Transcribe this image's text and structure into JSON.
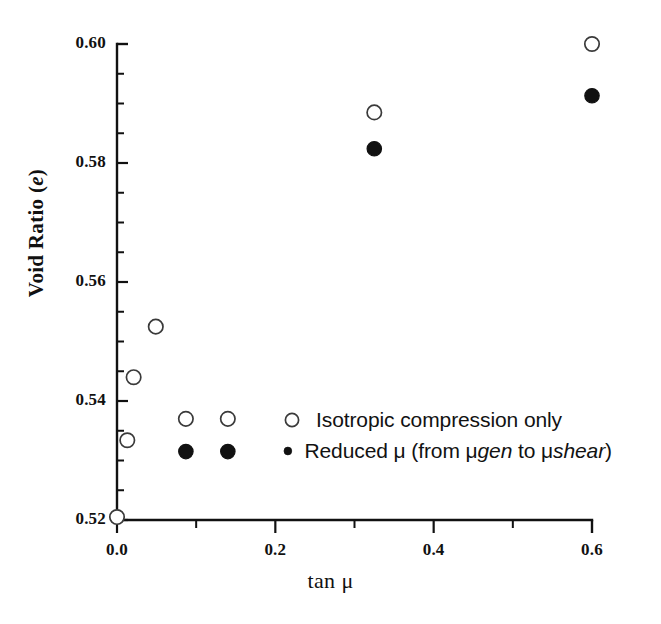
{
  "chart_data": {
    "type": "scatter",
    "title": "",
    "xlabel": "tan μ",
    "ylabel": "Void Ratio (e)",
    "ylabel_plain": "Void Ratio",
    "ylabel_italic": "e",
    "xlim": [
      0.0,
      0.6
    ],
    "ylim": [
      0.52,
      0.6
    ],
    "xticks": [
      0.0,
      0.2,
      0.4,
      0.6
    ],
    "xticklabels": [
      "0.0",
      "0.2",
      "0.4",
      "0.6"
    ],
    "x_minor_ticks": [
      0.1,
      0.3,
      0.5
    ],
    "yticks": [
      0.52,
      0.54,
      0.56,
      0.58,
      0.6
    ],
    "yticklabels": [
      "0.52",
      "0.54",
      "0.56",
      "0.58",
      "0.60"
    ],
    "y_minor_ticks": [
      0.525,
      0.53,
      0.535,
      0.545,
      0.55,
      0.555,
      0.565,
      0.57,
      0.575,
      0.585,
      0.59,
      0.595
    ],
    "grid": false,
    "legend_position": "center-right",
    "series": [
      {
        "name": "Isotropic compression only",
        "marker": "open-circle",
        "color": "#3a3a3a",
        "fill": "#ffffff",
        "points": [
          {
            "x": 0.0,
            "y": 0.5205
          },
          {
            "x": 0.013,
            "y": 0.5334
          },
          {
            "x": 0.021,
            "y": 0.544
          },
          {
            "x": 0.049,
            "y": 0.5525
          },
          {
            "x": 0.087,
            "y": 0.537
          },
          {
            "x": 0.14,
            "y": 0.537
          },
          {
            "x": 0.325,
            "y": 0.5885
          },
          {
            "x": 0.6,
            "y": 0.6
          }
        ]
      },
      {
        "name": "Reduced μ (from μgen to μshear)",
        "marker": "filled-circle",
        "color": "#111111",
        "fill": "#111111",
        "points": [
          {
            "x": 0.087,
            "y": 0.5315
          },
          {
            "x": 0.14,
            "y": 0.5315
          },
          {
            "x": 0.325,
            "y": 0.5824
          },
          {
            "x": 0.6,
            "y": 0.5913
          }
        ]
      }
    ]
  },
  "legend": {
    "items": [
      {
        "marker": "open-circle",
        "label": "Isotropic compression only",
        "label_parts": [
          {
            "text": "Isotropic compression only",
            "style": "normal"
          }
        ]
      },
      {
        "marker": "filled-circle",
        "label": "Reduced μ (from μgen to μshear)",
        "label_parts": [
          {
            "text": "Reduced μ (from μ",
            "style": "normal"
          },
          {
            "text": "gen",
            "style": "italic"
          },
          {
            "text": " to μ",
            "style": "normal"
          },
          {
            "text": "shear",
            "style": "italic"
          },
          {
            "text": ")",
            "style": "normal"
          }
        ]
      }
    ]
  },
  "axes": {
    "x_axis_label": "tan μ",
    "y_axis_label_prefix": "Void Ratio (",
    "y_axis_label_italic": "e",
    "y_axis_label_suffix": ")"
  },
  "colors": {
    "axis": "#111111",
    "open_marker_stroke": "#3a3a3a",
    "filled_marker": "#111111",
    "background": "#ffffff",
    "text": "#111111"
  }
}
